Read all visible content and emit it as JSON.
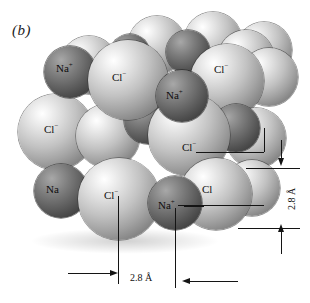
{
  "figure": {
    "panel_label": "(b)",
    "background_color": "#ffffff"
  },
  "ion_styles": {
    "cation_label": "Na",
    "cation_charge": "+",
    "cation_color": "#5e5e5e",
    "anion_label": "Cl",
    "anion_charge": "−",
    "anion_color": "#d0d0d0"
  },
  "ions": [
    {
      "id": "cl-back-1",
      "species": "Cl",
      "x": 130,
      "y": 18,
      "d": 56,
      "z": 1,
      "labeled": false
    },
    {
      "id": "cl-back-2",
      "species": "Cl",
      "x": 186,
      "y": 14,
      "d": 56,
      "z": 1,
      "labeled": false
    },
    {
      "id": "na-back-1",
      "species": "Na",
      "x": 168,
      "y": 32,
      "d": 42,
      "z": 2,
      "labeled": false
    },
    {
      "id": "cl-back-3",
      "species": "Cl",
      "x": 222,
      "y": 28,
      "d": 56,
      "z": 2,
      "labeled": false
    },
    {
      "id": "na-top-left",
      "species": "Na",
      "x": 48,
      "y": 48,
      "d": 48,
      "z": 4,
      "labeled": true,
      "label_x": 62,
      "label_y": 68
    },
    {
      "id": "cl-top-mid",
      "species": "Cl",
      "x": 86,
      "y": 42,
      "d": 76,
      "z": 5,
      "labeled": true,
      "label_x": 112,
      "label_y": 77
    },
    {
      "id": "na-top-mid2",
      "species": "Na",
      "x": 158,
      "y": 70,
      "d": 48,
      "z": 5,
      "labeled": true,
      "label_x": 168,
      "label_y": 94
    },
    {
      "id": "cl-top-rt",
      "species": "Cl",
      "x": 190,
      "y": 48,
      "d": 70,
      "z": 4,
      "labeled": true,
      "label_x": 215,
      "label_y": 70
    },
    {
      "id": "cl-top-rt2",
      "species": "Cl",
      "x": 244,
      "y": 50,
      "d": 56,
      "z": 3,
      "labeled": false
    },
    {
      "id": "cl-mid-left",
      "species": "Cl",
      "x": 22,
      "y": 96,
      "d": 72,
      "z": 3,
      "labeled": true,
      "label_x": 48,
      "label_y": 130
    },
    {
      "id": "cl-mid-2",
      "species": "Cl",
      "x": 78,
      "y": 104,
      "d": 62,
      "z": 4,
      "labeled": false
    },
    {
      "id": "na-mid-1",
      "species": "Na",
      "x": 126,
      "y": 100,
      "d": 48,
      "z": 4,
      "labeled": false
    },
    {
      "id": "cl-mid-3",
      "species": "Cl",
      "x": 152,
      "y": 96,
      "d": 76,
      "z": 5,
      "labeled": true,
      "label_x": 186,
      "label_y": 150
    },
    {
      "id": "na-mid-2",
      "species": "Na",
      "x": 216,
      "y": 104,
      "d": 46,
      "z": 4,
      "labeled": false
    },
    {
      "id": "cl-mid-4",
      "species": "Cl",
      "x": 228,
      "y": 110,
      "d": 58,
      "z": 3,
      "labeled": false
    },
    {
      "id": "na-low-left",
      "species": "Na",
      "x": 38,
      "y": 166,
      "d": 50,
      "z": 5,
      "labeled": true,
      "label_x": 50,
      "label_y": 192
    },
    {
      "id": "cl-low-1",
      "species": "Cl",
      "x": 82,
      "y": 160,
      "d": 76,
      "z": 6,
      "labeled": true,
      "label_x": 108,
      "label_y": 196
    },
    {
      "id": "na-low-2",
      "species": "Na",
      "x": 152,
      "y": 178,
      "d": 50,
      "z": 6,
      "labeled": true,
      "label_x": 160,
      "label_y": 206
    },
    {
      "id": "cl-low-2",
      "species": "Cl",
      "x": 182,
      "y": 160,
      "d": 68,
      "z": 5,
      "labeled": true,
      "label_x": 204,
      "label_y": 190
    },
    {
      "id": "cl-low-3",
      "species": "Cl",
      "x": 226,
      "y": 162,
      "d": 52,
      "z": 4,
      "labeled": false
    }
  ],
  "dimensions": [
    {
      "id": "vertical-spacing",
      "value": "2.8 Å",
      "orientation": "vertical",
      "text_x": 286,
      "text_y": 200
    },
    {
      "id": "horizontal-spacing",
      "value": "2.8 Å",
      "orientation": "horizontal",
      "text_x": 140,
      "text_y": 278
    }
  ]
}
